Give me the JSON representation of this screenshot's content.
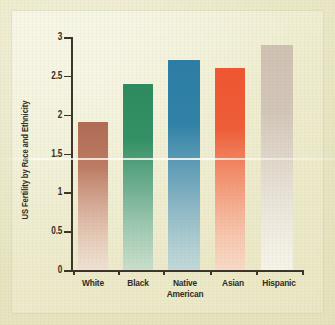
{
  "chart_data": {
    "type": "bar",
    "title": "",
    "subtitle": "",
    "xlabel": "",
    "ylabel": "US Fertility by Race and Ethnicity",
    "categories": [
      "White",
      "Black",
      "Native American",
      "Asian",
      "Hispanic"
    ],
    "values": [
      1.9,
      2.4,
      2.7,
      2.6,
      2.9
    ],
    "ylim": [
      0,
      3
    ],
    "yticks": [
      0,
      0.5,
      1,
      1.5,
      2,
      2.5,
      3
    ],
    "ytick_labels": [
      "0",
      "0.5",
      "1",
      "1.5",
      "2",
      "2.5",
      "3"
    ],
    "grid": false,
    "legend": null,
    "bar_colors": [
      "#b5705a",
      "#2f8f63",
      "#2d7fa8",
      "#ef5a32",
      "#cfc3b6"
    ],
    "annotations": []
  },
  "axis": {
    "line_color": "#3a3328",
    "tick_color": "#3a3328"
  },
  "figure": {
    "background_color": "#e8e6c3",
    "panel_color": "#f0eed2"
  }
}
